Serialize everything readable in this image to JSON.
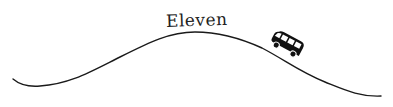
{
  "diagram": {
    "label": "Eleven",
    "vehicle_icon": "bus-icon",
    "colors": {
      "line": "#1a1a1a",
      "text": "#222222",
      "background": "#ffffff"
    }
  }
}
